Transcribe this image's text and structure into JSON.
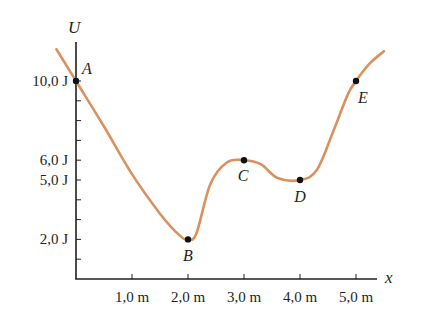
{
  "chart_data": {
    "type": "line",
    "title": "",
    "xlabel": "x",
    "ylabel": "U",
    "xlim": [
      0,
      5.4
    ],
    "ylim": [
      0,
      12
    ],
    "grid": false,
    "x_ticks": [
      1.0,
      2.0,
      3.0,
      4.0,
      5.0
    ],
    "x_tick_labels": [
      "1,0 m",
      "2,0 m",
      "3,0 m",
      "4,0 m",
      "5,0 m"
    ],
    "y_ticks": [
      1,
      2,
      3,
      4,
      5,
      6,
      7,
      8,
      9,
      10
    ],
    "y_tick_labels": [
      {
        "value": 10.0,
        "label": "10,0 J"
      },
      {
        "value": 6.0,
        "label": "6,0 J"
      },
      {
        "value": 5.0,
        "label": "5,0 J"
      },
      {
        "value": 2.0,
        "label": "2,0 J"
      }
    ],
    "series": [
      {
        "name": "U(x)",
        "color": "#D9925F",
        "x": [
          -0.35,
          0.0,
          0.5,
          1.0,
          1.5,
          1.85,
          2.0,
          2.15,
          2.4,
          2.7,
          3.0,
          3.3,
          3.6,
          4.0,
          4.3,
          4.6,
          4.85,
          5.0,
          5.25,
          5.5
        ],
        "y": [
          11.6,
          10.0,
          7.7,
          5.3,
          3.3,
          2.2,
          2.0,
          2.3,
          4.8,
          5.9,
          6.0,
          5.8,
          5.1,
          5.0,
          5.5,
          7.5,
          9.3,
          10.0,
          10.9,
          11.5
        ]
      }
    ],
    "annotations": [
      {
        "label": "A",
        "x": 0.0,
        "y": 10.0
      },
      {
        "label": "B",
        "x": 2.0,
        "y": 2.0
      },
      {
        "label": "C",
        "x": 3.0,
        "y": 6.0
      },
      {
        "label": "D",
        "x": 4.0,
        "y": 5.0
      },
      {
        "label": "E",
        "x": 5.0,
        "y": 10.0
      }
    ]
  }
}
